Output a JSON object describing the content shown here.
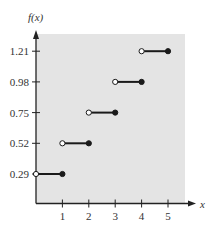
{
  "chart_data": {
    "type": "line",
    "subtype": "step-function",
    "title": "",
    "xlabel": "x",
    "ylabel": "f(x)",
    "x_ticks": [
      1,
      2,
      3,
      4,
      5
    ],
    "y_ticks": [
      0.29,
      0.52,
      0.75,
      0.98,
      1.21
    ],
    "y_tick_labels": [
      "0.29",
      "0.52",
      "0.75",
      "0.98",
      "1.21"
    ],
    "x_tick_labels": [
      "1",
      "2",
      "3",
      "4",
      "5"
    ],
    "xlim": [
      0,
      5.6
    ],
    "ylim": [
      0,
      1.37
    ],
    "grid": false,
    "legend": null,
    "segments": [
      {
        "x_start": 0,
        "x_end": 1,
        "y": 0.29,
        "start": "open",
        "end": "closed"
      },
      {
        "x_start": 1,
        "x_end": 2,
        "y": 0.52,
        "start": "open",
        "end": "closed"
      },
      {
        "x_start": 2,
        "x_end": 3,
        "y": 0.75,
        "start": "open",
        "end": "closed"
      },
      {
        "x_start": 3,
        "x_end": 4,
        "y": 0.98,
        "start": "open",
        "end": "closed"
      },
      {
        "x_start": 4,
        "x_end": 5,
        "y": 1.21,
        "start": "open",
        "end": "closed"
      }
    ]
  },
  "style": {
    "plot_background": "#e4e4e4",
    "line_color": "#1a1a1a",
    "axis_color": "#222222",
    "open_fill": "#ffffff"
  }
}
